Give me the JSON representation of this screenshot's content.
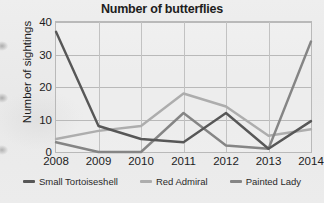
{
  "chart_data": {
    "type": "line",
    "title": "Number of butterflies",
    "xlabel": "",
    "ylabel": "Number of sightings",
    "categories": [
      "2008",
      "2009",
      "2010",
      "2011",
      "2012",
      "2013",
      "2014"
    ],
    "x": [
      2008,
      2009,
      2010,
      2011,
      2012,
      2013,
      2014
    ],
    "ylim": [
      0,
      40
    ],
    "yticks": [
      "0",
      "10",
      "20",
      "30",
      "40"
    ],
    "ytick_values": [
      0,
      10,
      20,
      30,
      40
    ],
    "grid": true,
    "legend_position": "bottom",
    "series": [
      {
        "name": "Small Tortoiseshell",
        "color": "#575757",
        "values": [
          37,
          8,
          4,
          3,
          12,
          1,
          9.5
        ]
      },
      {
        "name": "Red Admiral",
        "color": "#adadad",
        "values": [
          4,
          6.5,
          8,
          18,
          14,
          5,
          7
        ]
      },
      {
        "name": "Painted Lady",
        "color": "#858585",
        "values": [
          3,
          0,
          0,
          12,
          2,
          1,
          34
        ]
      }
    ]
  },
  "legend": {
    "items": [
      {
        "label": "Small Tortoiseshell",
        "color": "#575757"
      },
      {
        "label": "Red Admiral",
        "color": "#adadad"
      },
      {
        "label": "Painted Lady",
        "color": "#858585"
      }
    ]
  }
}
